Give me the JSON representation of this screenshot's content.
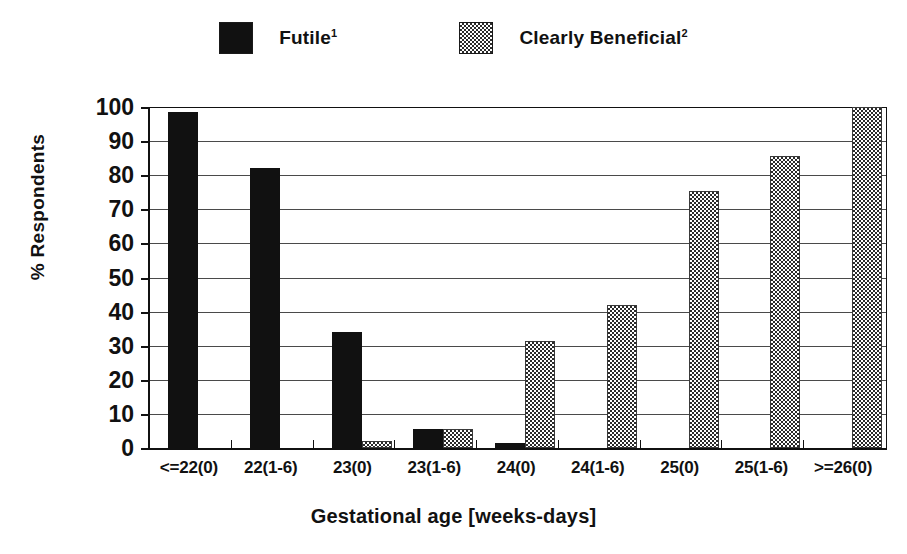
{
  "chart_data": {
    "type": "bar",
    "title": "",
    "xlabel": "Gestational age [weeks-days]",
    "ylabel": "% Respondents",
    "ylim": [
      0,
      100
    ],
    "yticks": [
      0,
      10,
      20,
      30,
      40,
      50,
      60,
      70,
      80,
      90,
      100
    ],
    "ytick_labels": [
      "0",
      "10",
      "20",
      "30",
      "40",
      "50",
      "60",
      "70",
      "80",
      "90",
      "100"
    ],
    "grid": true,
    "legend_position": "top-center",
    "categories": [
      "<=22(0)",
      "22(1-6)",
      "23(0)",
      "23(1-6)",
      "24(0)",
      "24(1-6)",
      "25(0)",
      "25(1-6)",
      ">=26(0)"
    ],
    "series": [
      {
        "name": "Futile",
        "name_superscript": "1",
        "swatch": "solid-black",
        "color": "#111111",
        "values": [
          98.5,
          82,
          34,
          5.5,
          1.5,
          0,
          0,
          0,
          0
        ]
      },
      {
        "name": "Clearly Beneficial",
        "name_superscript": "2",
        "swatch": "checkered-gray",
        "color": "#808080",
        "values": [
          0,
          0,
          2,
          5.5,
          31.5,
          42,
          75.5,
          85.5,
          100
        ]
      }
    ]
  },
  "legend": {
    "items": [
      {
        "label": "Futile",
        "sup": "1",
        "swatch_name": "legend-swatch-futile"
      },
      {
        "label": "Clearly Beneficial",
        "sup": "2",
        "swatch_name": "legend-swatch-clearly-beneficial"
      }
    ]
  },
  "axes": {
    "y_title": "% Respondents",
    "x_title": "Gestational age [weeks-days]"
  }
}
